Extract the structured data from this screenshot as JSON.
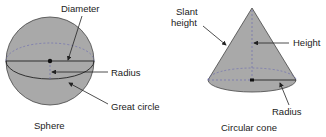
{
  "colors": {
    "fill": "#a9a9a9",
    "stroke": "#333333",
    "dashed": "#6f6fb0",
    "text": "#222222"
  },
  "sphere": {
    "caption": "Sphere",
    "labels": {
      "diameter": "Diameter",
      "radius": "Radius",
      "great_circle": "Great circle"
    }
  },
  "cone": {
    "caption": "Circular cone",
    "labels": {
      "slant_height_line1": "Slant",
      "slant_height_line2": "height",
      "height": "Height",
      "radius": "Radius"
    }
  }
}
